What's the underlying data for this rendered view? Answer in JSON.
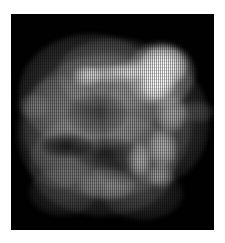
{
  "viewer": {
    "width": 225,
    "height": 243,
    "page_background": "#ffffff",
    "title": "Scintigraphy Scan",
    "alt_text": "Grayscale nuclear medicine scan of an irregular organ with a bright focal hotspot in the upper right quadrant"
  },
  "scan": {
    "frame_background": "#000000",
    "colormap": "grayscale",
    "modality_label": "planar scintigraphy",
    "frame": {
      "x": 11,
      "y": 14,
      "width": 203,
      "height": 216
    },
    "artifact": "vertical line-scan interlace striping",
    "intensity_scale": {
      "min_label": "0",
      "max_label": "max",
      "background_color": "#000000",
      "low_color": "#2a2a2a",
      "mid_color": "#808080",
      "high_color": "#ffffff"
    }
  },
  "chart_data": {
    "type": "heatmap",
    "xlabel": "",
    "ylabel": "",
    "grid": false,
    "legend": "none",
    "xlim": [
      0,
      203
    ],
    "ylim": [
      0,
      216
    ],
    "colorscale": [
      "#000000",
      "#3a3a3a",
      "#808080",
      "#c8c8c8",
      "#ffffff"
    ],
    "body_mass": [
      {
        "name": "organ-bulk-upper-left",
        "cx": 80,
        "cy": 78,
        "rx": 72,
        "ry": 58,
        "peak": 72
      },
      {
        "name": "organ-bulk-center",
        "cx": 96,
        "cy": 112,
        "rx": 84,
        "ry": 72,
        "peak": 66
      },
      {
        "name": "organ-bulk-lower",
        "cx": 92,
        "cy": 150,
        "rx": 74,
        "ry": 52,
        "peak": 60
      },
      {
        "name": "organ-bulk-right",
        "cx": 146,
        "cy": 108,
        "rx": 52,
        "ry": 62,
        "peak": 64
      },
      {
        "name": "organ-bulk-upper-dome",
        "cx": 104,
        "cy": 60,
        "rx": 58,
        "ry": 36,
        "peak": 62
      },
      {
        "name": "organ-bulk-left-lobe",
        "cx": 48,
        "cy": 118,
        "rx": 42,
        "ry": 56,
        "peak": 58
      },
      {
        "name": "left-protrusion-spur",
        "cx": 22,
        "cy": 92,
        "rx": 16,
        "ry": 12,
        "peak": 46
      },
      {
        "name": "right-protrusion-spur",
        "cx": 186,
        "cy": 98,
        "rx": 18,
        "ry": 11,
        "peak": 48
      },
      {
        "name": "lower-left-taper",
        "cx": 52,
        "cy": 178,
        "rx": 34,
        "ry": 24,
        "peak": 44
      },
      {
        "name": "lower-right-taper",
        "cx": 132,
        "cy": 180,
        "rx": 40,
        "ry": 26,
        "peak": 46
      }
    ],
    "hotspots": [
      {
        "name": "primary-focal-hotspot",
        "cx": 152,
        "cy": 52,
        "rx": 24,
        "ry": 20,
        "peak": 255
      },
      {
        "name": "primary-hotspot-tail",
        "cx": 146,
        "cy": 70,
        "rx": 17,
        "ry": 16,
        "peak": 240
      },
      {
        "name": "hotspot-halo",
        "cx": 150,
        "cy": 60,
        "rx": 34,
        "ry": 32,
        "peak": 150
      },
      {
        "name": "linear-uptake-streak",
        "cx": 104,
        "cy": 60,
        "rx": 34,
        "ry": 9,
        "peak": 140
      },
      {
        "name": "streak-nodule-left",
        "cx": 76,
        "cy": 62,
        "rx": 14,
        "ry": 10,
        "peak": 150
      },
      {
        "name": "streak-bridge",
        "cx": 120,
        "cy": 56,
        "rx": 20,
        "ry": 8,
        "peak": 120
      },
      {
        "name": "secondary-nodule-upper",
        "cx": 160,
        "cy": 100,
        "rx": 15,
        "ry": 18,
        "peak": 135
      },
      {
        "name": "secondary-nodule-mid",
        "cx": 152,
        "cy": 134,
        "rx": 14,
        "ry": 19,
        "peak": 128
      },
      {
        "name": "secondary-nodule-lower",
        "cx": 128,
        "cy": 146,
        "rx": 11,
        "ry": 16,
        "peak": 120
      },
      {
        "name": "faint-nodule-inferior",
        "cx": 150,
        "cy": 162,
        "rx": 12,
        "ry": 12,
        "peak": 96
      },
      {
        "name": "rim-uptake-lower-center",
        "cx": 96,
        "cy": 170,
        "rx": 28,
        "ry": 16,
        "peak": 84
      }
    ],
    "voids": [
      {
        "name": "photopenic-void-left",
        "cx": 56,
        "cy": 132,
        "rx": 26,
        "ry": 12,
        "depth": 0.82
      },
      {
        "name": "photopenic-void-center",
        "cx": 96,
        "cy": 140,
        "rx": 34,
        "ry": 16,
        "depth": 0.66
      },
      {
        "name": "photopenic-void-upper",
        "cx": 86,
        "cy": 100,
        "rx": 30,
        "ry": 20,
        "depth": 0.42
      },
      {
        "name": "photopenic-void-inferior",
        "cx": 110,
        "cy": 158,
        "rx": 22,
        "ry": 12,
        "depth": 0.46
      }
    ]
  }
}
